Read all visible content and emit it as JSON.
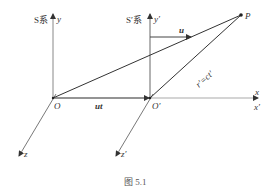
{
  "figure": {
    "caption": "图 5.1",
    "frames": {
      "s_frame": {
        "label": "S系",
        "y_axis": "y",
        "z_axis": "z",
        "origin": "O"
      },
      "s_prime_frame": {
        "label": "S′系",
        "y_axis": "y′",
        "z_axis": "z′",
        "origin": "O′"
      }
    },
    "x_axis_label": "x",
    "x_prime_axis_label": "x′",
    "velocity_label": "u",
    "displacement_label": "ut",
    "point_label": "P",
    "distance_label": "r′=ct′",
    "colors": {
      "line": "#444444",
      "text": "#333333",
      "axis": "#777777"
    }
  }
}
